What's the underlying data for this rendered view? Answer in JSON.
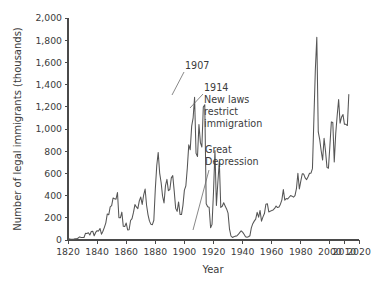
{
  "chart_data": {
    "type": "line",
    "title": "",
    "xlabel": "Year",
    "ylabel": "Number of legal immigrants (thousands)",
    "xlim": [
      1820,
      2020
    ],
    "ylim": [
      0,
      2000
    ],
    "grid": false,
    "legend": "none",
    "x_ticks": [
      1820,
      1840,
      1860,
      1880,
      1900,
      1920,
      1940,
      1960,
      1980,
      2000,
      2010,
      2020
    ],
    "x_tick_labels": [
      "1820",
      "1840",
      "1860",
      "1880",
      "1900",
      "1920",
      "1940",
      "1960",
      "1980",
      "2000",
      "2010",
      "2020"
    ],
    "y_ticks": [
      0,
      200,
      400,
      600,
      800,
      1000,
      1200,
      1400,
      1600,
      1800,
      2000
    ],
    "y_tick_labels": [
      "0",
      "200",
      "400",
      "600",
      "800",
      "1,000",
      "1,200",
      "1,400",
      "1,600",
      "1,800",
      "2,000"
    ],
    "series": [
      {
        "name": "Legal immigrants",
        "color": "#555555",
        "x": [
          1820,
          1821,
          1822,
          1823,
          1824,
          1825,
          1826,
          1827,
          1828,
          1829,
          1830,
          1831,
          1832,
          1833,
          1834,
          1835,
          1836,
          1837,
          1838,
          1839,
          1840,
          1841,
          1842,
          1843,
          1844,
          1845,
          1846,
          1847,
          1848,
          1849,
          1850,
          1851,
          1852,
          1853,
          1854,
          1855,
          1856,
          1857,
          1858,
          1859,
          1860,
          1861,
          1862,
          1863,
          1864,
          1865,
          1866,
          1867,
          1868,
          1869,
          1870,
          1871,
          1872,
          1873,
          1874,
          1875,
          1876,
          1877,
          1878,
          1879,
          1880,
          1881,
          1882,
          1883,
          1884,
          1885,
          1886,
          1887,
          1888,
          1889,
          1890,
          1891,
          1892,
          1893,
          1894,
          1895,
          1896,
          1897,
          1898,
          1899,
          1900,
          1901,
          1902,
          1903,
          1904,
          1905,
          1906,
          1907,
          1908,
          1909,
          1910,
          1911,
          1912,
          1913,
          1914,
          1915,
          1916,
          1917,
          1918,
          1919,
          1920,
          1921,
          1922,
          1923,
          1924,
          1925,
          1926,
          1927,
          1928,
          1929,
          1930,
          1931,
          1932,
          1933,
          1934,
          1935,
          1936,
          1937,
          1938,
          1939,
          1940,
          1941,
          1942,
          1943,
          1944,
          1945,
          1946,
          1947,
          1948,
          1949,
          1950,
          1951,
          1952,
          1953,
          1954,
          1955,
          1956,
          1957,
          1958,
          1959,
          1960,
          1961,
          1962,
          1963,
          1964,
          1965,
          1966,
          1967,
          1968,
          1969,
          1970,
          1971,
          1972,
          1973,
          1974,
          1975,
          1976,
          1977,
          1978,
          1979,
          1980,
          1981,
          1982,
          1983,
          1984,
          1985,
          1986,
          1987,
          1988,
          1989,
          1990,
          1991,
          1992,
          1993,
          1994,
          1995,
          1996,
          1997,
          1998,
          1999,
          2000,
          2001,
          2002,
          2003,
          2004,
          2005,
          2006,
          2007,
          2008,
          2009,
          2010,
          2011,
          2012,
          2013
        ],
        "values": [
          8,
          10,
          7,
          7,
          8,
          10,
          11,
          18,
          28,
          22,
          23,
          23,
          60,
          59,
          65,
          45,
          76,
          79,
          38,
          68,
          84,
          80,
          104,
          52,
          79,
          114,
          155,
          235,
          227,
          298,
          310,
          379,
          372,
          368,
          428,
          200,
          200,
          251,
          123,
          121,
          153,
          91,
          92,
          176,
          193,
          248,
          319,
          298,
          282,
          352,
          387,
          321,
          405,
          459,
          313,
          227,
          170,
          141,
          138,
          178,
          457,
          669,
          789,
          603,
          518,
          395,
          334,
          490,
          546,
          444,
          455,
          560,
          580,
          440,
          285,
          258,
          343,
          231,
          229,
          312,
          449,
          488,
          649,
          857,
          813,
          1026,
          1101,
          1285,
          782,
          752,
          1041,
          878,
          838,
          1198,
          1218,
          327,
          299,
          295,
          110,
          141,
          430,
          805,
          310,
          523,
          707,
          294,
          304,
          335,
          307,
          280,
          242,
          97,
          36,
          23,
          29,
          35,
          36,
          50,
          67,
          83,
          71,
          52,
          29,
          24,
          29,
          38,
          109,
          147,
          170,
          188,
          249,
          206,
          266,
          170,
          208,
          238,
          322,
          327,
          253,
          260,
          265,
          271,
          284,
          306,
          292,
          297,
          323,
          362,
          454,
          359,
          373,
          370,
          385,
          400,
          395,
          386,
          399,
          462,
          601,
          460,
          531,
          597,
          594,
          560,
          544,
          570,
          602,
          602,
          643,
          1091,
          1536,
          1827,
          974,
          904,
          804,
          720,
          916,
          798,
          654,
          647,
          850,
          1064,
          1059,
          704,
          958,
          1122,
          1266,
          1052,
          1107,
          1130,
          1042,
          1042,
          1031,
          1310
        ]
      }
    ],
    "annotations": [
      {
        "id": "annot-1907",
        "text": "1907",
        "lines": [
          "1907"
        ],
        "text_x": 185,
        "text_y": 69,
        "leader": {
          "x1": 184,
          "y1": 72,
          "x2": 172,
          "y2": 95
        }
      },
      {
        "id": "annot-1914",
        "text": "1914 New laws restrict immigration",
        "lines": [
          "1914",
          "New laws",
          "restrict",
          "immigration"
        ],
        "text_x": 204,
        "text_y": 91,
        "leader": {
          "x1": 203,
          "y1": 94,
          "x2": 190,
          "y2": 108
        }
      },
      {
        "id": "annot-great-depression",
        "text": "Great Depression",
        "lines": [
          "Great",
          "Depression"
        ],
        "text_x": 205,
        "text_y": 153,
        "leader": {
          "x1": 209,
          "y1": 170,
          "x2": 193,
          "y2": 230
        }
      }
    ],
    "peak_callouts": [
      {
        "year": 1907,
        "value": 1285
      },
      {
        "year": 1914,
        "value": 1218
      },
      {
        "year": 1991,
        "value": 1827
      },
      {
        "year": 1933,
        "value": 23
      }
    ]
  },
  "style": {
    "line_color": "#555555",
    "axis_color": "#4a4a4a",
    "text_color": "#3b3b3b",
    "background": "#ffffff"
  },
  "plot_geometry": {
    "left": 68,
    "right": 359,
    "top": 18,
    "bottom": 240
  }
}
